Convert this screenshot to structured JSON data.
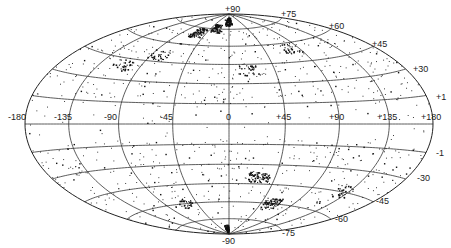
{
  "chart_data": {
    "type": "scatter",
    "projection": "hammer-aitoff (all-sky, equal-area)",
    "title": "",
    "xlabel": "Longitude (deg)",
    "ylabel": "Latitude (deg)",
    "grid": true,
    "legend": null,
    "longitude_ticks": [
      -180,
      -135,
      -90,
      -45,
      0,
      45,
      90,
      135,
      180
    ],
    "longitude_labels": [
      "-180",
      "-135",
      "-90",
      "-45",
      "0",
      "+45",
      "+90",
      "+135",
      "+180"
    ],
    "latitude_ticks": [
      90,
      75,
      60,
      45,
      30,
      15,
      -15,
      -30,
      -45,
      -60,
      -75,
      -90
    ],
    "latitude_labels_north": [
      "+90",
      "+75",
      "+60",
      "+45",
      "+30",
      "+1"
    ],
    "latitude_labels_south": [
      "-1",
      "-30",
      "-45",
      "-60",
      "-75",
      "-90"
    ],
    "xlim": [
      -180,
      180
    ],
    "ylim": [
      -90,
      90
    ],
    "clusters": [
      {
        "lon": -60,
        "lat": 70,
        "density": "high"
      },
      {
        "lon": -30,
        "lat": 75,
        "density": "high"
      },
      {
        "lon": 0,
        "lat": 82,
        "density": "high"
      },
      {
        "lon": 20,
        "lat": 40,
        "density": "medium"
      },
      {
        "lon": 80,
        "lat": 55,
        "density": "medium"
      },
      {
        "lon": -110,
        "lat": 40,
        "density": "medium"
      },
      {
        "lon": -80,
        "lat": 50,
        "density": "medium"
      },
      {
        "lon": -10,
        "lat": -85,
        "density": "high"
      },
      {
        "lon": 30,
        "lat": -40,
        "density": "high"
      },
      {
        "lon": 60,
        "lat": -60,
        "density": "high"
      },
      {
        "lon": 130,
        "lat": -45,
        "density": "medium"
      },
      {
        "lon": -60,
        "lat": -60,
        "density": "medium"
      }
    ]
  },
  "labels": {
    "lon": [
      "-180",
      "-135",
      "-90",
      "-45",
      "0",
      "+45",
      "+90",
      "+135",
      "+180"
    ],
    "north": [
      "+90",
      "+75",
      "+60",
      "+45",
      "+30",
      "+1"
    ],
    "south": [
      "-1",
      "-30",
      "-45",
      "-60",
      "-75",
      "-90"
    ]
  }
}
